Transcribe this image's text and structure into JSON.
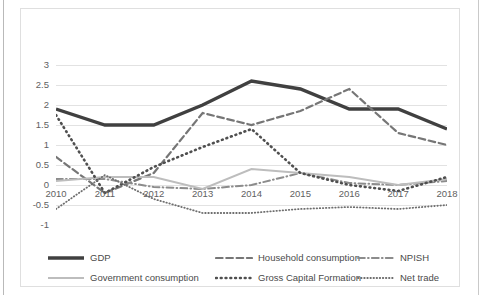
{
  "chart_data": {
    "type": "line",
    "title": "",
    "xlabel": "",
    "ylabel": "",
    "x": [
      2010,
      2011,
      2012,
      2013,
      2014,
      2015,
      2016,
      2017,
      2018
    ],
    "categories": [
      "2010",
      "2011",
      "2012",
      "2013",
      "2014",
      "2015",
      "2016",
      "2017",
      "2018"
    ],
    "ylim": [
      -1,
      3
    ],
    "yticks": [
      3,
      2.5,
      2,
      1.5,
      1,
      0.5,
      0,
      -0.5,
      -1
    ],
    "ytick_labels": [
      "3",
      "2.5",
      "2",
      "1.5",
      "1",
      "0.5",
      "0",
      "-0.5",
      "-1"
    ],
    "grid": true,
    "grid_axis": "y",
    "legend_position": "bottom",
    "series": [
      {
        "name": "GDP",
        "values": [
          1.9,
          1.5,
          1.5,
          2.0,
          2.6,
          2.4,
          1.9,
          1.9,
          1.4
        ],
        "color": "#404040",
        "style": "solid",
        "width": 3.4
      },
      {
        "name": "Household consumption",
        "values": [
          0.7,
          -0.2,
          0.3,
          1.8,
          1.5,
          1.85,
          2.4,
          1.3,
          1.0
        ],
        "color": "#767676",
        "style": "dashed",
        "width": 2.2
      },
      {
        "name": "NPISH",
        "values": [
          0.15,
          0.15,
          -0.05,
          -0.1,
          0.0,
          0.3,
          0.05,
          0.0,
          0.1
        ],
        "color": "#8c8c8c",
        "style": "dash-dot",
        "width": 2.0
      },
      {
        "name": "Government consumption",
        "values": [
          0.1,
          0.2,
          0.2,
          -0.1,
          0.4,
          0.3,
          0.2,
          0.0,
          0.15
        ],
        "color": "#bdbdbd",
        "style": "solid",
        "width": 2.0
      },
      {
        "name": "Gross Capital Formation",
        "values": [
          1.75,
          -0.2,
          0.45,
          0.95,
          1.4,
          0.3,
          0.0,
          -0.15,
          0.2
        ],
        "color": "#4f4f4f",
        "style": "dotted-thick",
        "width": 2.6
      },
      {
        "name": "Net trade",
        "values": [
          -0.6,
          0.25,
          -0.35,
          -0.7,
          -0.7,
          -0.6,
          -0.55,
          -0.6,
          -0.5
        ],
        "color": "#6e6e6e",
        "style": "dotted-fine",
        "width": 1.8
      }
    ]
  },
  "legend": {
    "rows": [
      [
        {
          "label": "GDP",
          "series": 0
        },
        {
          "label": "Household consumption",
          "series": 1
        },
        {
          "label": "NPISH",
          "series": 2
        }
      ],
      [
        {
          "label": "Government consumption",
          "series": 3
        },
        {
          "label": "Gross Capital Formation",
          "series": 4
        },
        {
          "label": "Net trade",
          "series": 5
        }
      ]
    ]
  },
  "colors": {
    "background": "#ffffff",
    "frame": "#dfdfdf",
    "gridline": "#e2e2e2",
    "axis_text": "#616161",
    "legend_text": "#4a4a4a"
  }
}
